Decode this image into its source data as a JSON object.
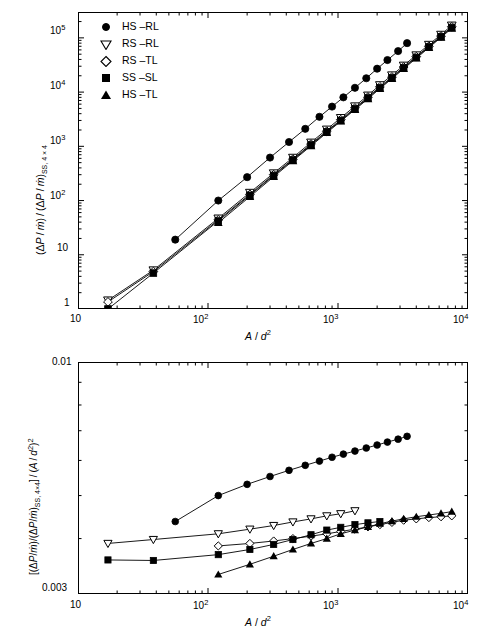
{
  "figure": {
    "panels": [
      {
        "id": "top",
        "xlabel": "A / d²",
        "ylabel": "(ΔP / ṁ) / (ΔP / ṁ)SS, 4 × 4",
        "xticks": [
          "10",
          "10²",
          "10³",
          "10⁴"
        ],
        "yticks": [
          "1",
          "10",
          "10²",
          "10³",
          "10⁴",
          "10⁵"
        ]
      },
      {
        "id": "bottom",
        "xlabel": "A / d²",
        "ylabel": "[(ΔP/ṁ)/(ΔP/ṁ)SS, 4×4] / (A / d²)²",
        "xticks": [
          "10",
          "10²",
          "10³",
          "10⁴"
        ],
        "yticks": [
          "0.003",
          "0.01"
        ]
      }
    ],
    "legend": {
      "position": "top-left",
      "entries": [
        {
          "label": "HS –RL",
          "marker": "filled-circle"
        },
        {
          "label": "RS –RL",
          "marker": "open-triangle-down"
        },
        {
          "label": "RS –TL",
          "marker": "open-diamond"
        },
        {
          "label": "SS –SL",
          "marker": "filled-square"
        },
        {
          "label": "HS –TL",
          "marker": "filled-triangle-up"
        }
      ]
    }
  },
  "chart_data": [
    {
      "type": "scatter",
      "id": "top-panel",
      "title": "",
      "xlabel": "A / d²",
      "ylabel": "(ΔP / ṁ) / (ΔP / ṁ)SS, 4 × 4",
      "xscale": "log",
      "yscale": "log",
      "xlim": [
        10,
        10000
      ],
      "ylim": [
        1,
        300000
      ],
      "grid": false,
      "legend_position": "upper-left",
      "series": [
        {
          "name": "HS –RL",
          "marker": "filled-circle",
          "x": [
            56,
            120,
            200,
            300,
            420,
            560,
            720,
            900,
            1100,
            1350,
            1650,
            2000,
            2400,
            2900,
            3400
          ],
          "y": [
            19,
            100,
            270,
            620,
            1200,
            2100,
            3500,
            5400,
            8000,
            12000,
            18000,
            27000,
            39000,
            57000,
            80000
          ]
        },
        {
          "name": "RS –RL",
          "marker": "open-triangle-down",
          "x": [
            17,
            38,
            120,
            210,
            320,
            450,
            620,
            820,
            1050,
            1350,
            1700,
            2100,
            2600,
            3200,
            4000,
            5000,
            6200,
            7500
          ],
          "y": [
            1.45,
            5.2,
            47,
            140,
            320,
            620,
            1180,
            2050,
            3350,
            5500,
            8700,
            13500,
            20500,
            31000,
            48000,
            75000,
            115000,
            170000
          ]
        },
        {
          "name": "RS –TL",
          "marker": "open-diamond",
          "x": [
            17,
            38,
            120,
            210,
            320,
            450,
            620,
            820,
            1050,
            1350,
            1700,
            2100,
            2600,
            3200,
            4000,
            5000,
            6200,
            7500
          ],
          "y": [
            1.35,
            4.9,
            44,
            130,
            300,
            580,
            1100,
            1900,
            3100,
            5100,
            8100,
            12500,
            19000,
            29000,
            45000,
            70000,
            108000,
            160000
          ]
        },
        {
          "name": "SS –SL",
          "marker": "filled-square",
          "x": [
            17,
            38,
            120,
            210,
            320,
            450,
            620,
            820,
            1050,
            1350,
            1700,
            2100,
            2600,
            3200,
            4000,
            5000,
            6200,
            7500
          ],
          "y": [
            1.0,
            4.6,
            42,
            125,
            290,
            560,
            1060,
            1850,
            3000,
            4900,
            7800,
            12000,
            18300,
            28000,
            43500,
            68000,
            105000,
            155000
          ]
        },
        {
          "name": "HS –TL",
          "marker": "filled-triangle-up",
          "x": [
            120,
            210,
            320,
            450,
            620,
            820,
            1050,
            1350,
            1700,
            2100,
            2600,
            3200,
            4000,
            5000,
            6200,
            7500
          ],
          "y": [
            39,
            118,
            275,
            540,
            1020,
            1780,
            2900,
            4750,
            7500,
            11600,
            17700,
            27000,
            42000,
            66000,
            102000,
            150000
          ]
        }
      ]
    },
    {
      "type": "scatter",
      "id": "bottom-panel",
      "title": "",
      "xlabel": "A / d²",
      "ylabel": "[(ΔP/ṁ)/(ΔP/ṁ)SS, 4×4] / (A / d²)²",
      "xscale": "log",
      "yscale": "log",
      "xlim": [
        10,
        10000
      ],
      "ylim": [
        0.003,
        0.01
      ],
      "grid": false,
      "legend_position": "none",
      "series": [
        {
          "name": "HS –RL",
          "marker": "filled-circle",
          "x": [
            56,
            120,
            200,
            300,
            420,
            560,
            720,
            900,
            1100,
            1350,
            1650,
            2000,
            2400,
            2900,
            3400
          ],
          "y": [
            0.00437,
            0.005,
            0.0053,
            0.00552,
            0.0057,
            0.00585,
            0.00598,
            0.0061,
            0.0062,
            0.0063,
            0.0064,
            0.0065,
            0.0066,
            0.0067,
            0.0068
          ]
        },
        {
          "name": "RS –RL",
          "marker": "open-triangle-down",
          "x": [
            17,
            38,
            120,
            210,
            320,
            450,
            620,
            820,
            1050,
            1350
          ],
          "y": [
            0.0039,
            0.00398,
            0.0041,
            0.0042,
            0.00428,
            0.00436,
            0.00443,
            0.0045,
            0.00455,
            0.00462
          ]
        },
        {
          "name": "RS –TL",
          "marker": "open-diamond",
          "x": [
            120,
            210,
            320,
            450,
            620,
            820,
            1050,
            1350,
            1700,
            2100,
            2600,
            3200,
            4000,
            5000,
            6200,
            7500
          ],
          "y": [
            0.00385,
            0.0039,
            0.00395,
            0.004,
            0.00405,
            0.0041,
            0.00415,
            0.0042,
            0.00425,
            0.0043,
            0.00435,
            0.0044,
            0.00443,
            0.00446,
            0.00448,
            0.0045
          ]
        },
        {
          "name": "SS –SL",
          "marker": "filled-square",
          "x": [
            17,
            38,
            120,
            210,
            320,
            450,
            620,
            820,
            1050,
            1350,
            1700,
            2100
          ],
          "y": [
            0.00358,
            0.00357,
            0.00368,
            0.00378,
            0.00388,
            0.00398,
            0.00408,
            0.00418,
            0.00424,
            0.0043,
            0.00434,
            0.00437
          ]
        },
        {
          "name": "HS –TL",
          "marker": "filled-triangle-up",
          "x": [
            120,
            210,
            320,
            450,
            620,
            820,
            1050,
            1350,
            1700,
            2100,
            2600,
            3200,
            4000,
            5000,
            6200,
            7500
          ],
          "y": [
            0.00332,
            0.0035,
            0.00365,
            0.00378,
            0.0039,
            0.004,
            0.0041,
            0.00418,
            0.00425,
            0.00432,
            0.00438,
            0.00443,
            0.00448,
            0.00452,
            0.00456,
            0.0046
          ]
        }
      ]
    }
  ]
}
